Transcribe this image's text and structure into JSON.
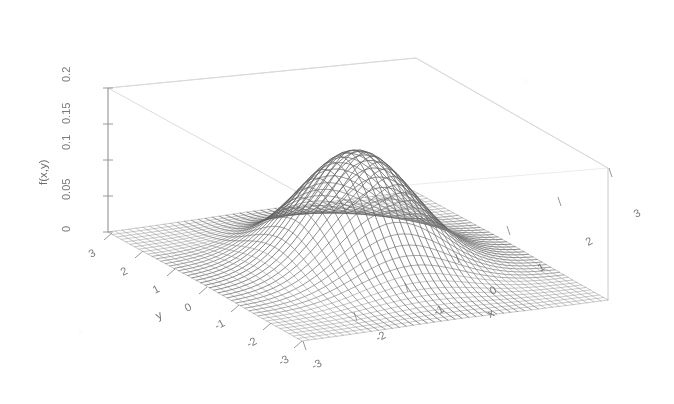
{
  "figure": {
    "type": "3d-mesh-surface-plot",
    "background_color": "#ffffff",
    "mesh_color": "#6b6b6b",
    "axis_color": "#9a9a9a",
    "label_color": "#7a7a7a",
    "box_color": "#d8d8d8",
    "render_style": "wireframe-mesh"
  },
  "chart_data": {
    "type": "surface",
    "title": "",
    "subtitle": "",
    "xlabel": "x",
    "ylabel": "y",
    "zlabel": "f(x,y)",
    "xlim": [
      -3,
      3
    ],
    "ylim": [
      -3,
      3
    ],
    "zlim": [
      0,
      0.2
    ],
    "x_ticks": [
      -3,
      -2,
      -1,
      0,
      1,
      2,
      3
    ],
    "x_tick_labels": [
      "-3",
      "-2",
      "-1",
      "0",
      "1",
      "2",
      "3"
    ],
    "y_ticks": [
      -3,
      -2,
      -1,
      0,
      1,
      2,
      3
    ],
    "y_tick_labels": [
      "-3",
      "-2",
      "-1",
      "0",
      "1",
      "2",
      "3"
    ],
    "z_ticks": [
      0,
      0.05,
      0.1,
      0.15,
      0.2
    ],
    "z_tick_labels": [
      "0",
      "0.05",
      "0.1",
      "0.15",
      "0.2"
    ],
    "grid": false,
    "legend": "none",
    "mesh_divisions_x": 44,
    "mesh_divisions_y": 44,
    "function": "bivariate gaussian: f(x,y) = (1/(2*pi)) * exp(-(x^2 + y^2)/2)",
    "peak_value": 0.159,
    "peak_location": [
      0,
      0
    ],
    "view_azimuth_deg": -37.5,
    "view_elevation_deg": 30,
    "annotations": []
  },
  "axes": {
    "x": {
      "label": "x",
      "ticks": [
        "-3",
        "-2",
        "-1",
        "0",
        "1",
        "2",
        "3"
      ]
    },
    "y": {
      "label": "y",
      "ticks": [
        "3",
        "2",
        "1",
        "0",
        "-1",
        "-2",
        "-3"
      ]
    },
    "z": {
      "label": "f(x,y)",
      "ticks": [
        "0",
        "0.05",
        "0.1",
        "0.15",
        "0.2"
      ]
    }
  }
}
